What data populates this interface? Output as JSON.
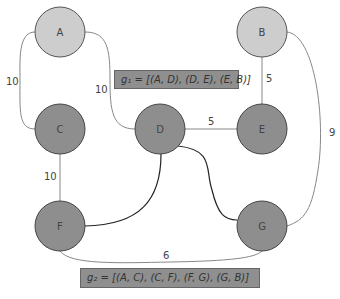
{
  "nodes": [
    {
      "id": "A",
      "label": "A",
      "x": 60,
      "y": 32,
      "fill": "#cdcdcd"
    },
    {
      "id": "B",
      "label": "B",
      "x": 262,
      "y": 32,
      "fill": "#cdcdcd"
    },
    {
      "id": "C",
      "label": "C",
      "x": 60,
      "y": 129,
      "fill": "#8e8e8e"
    },
    {
      "id": "D",
      "label": "D",
      "x": 160,
      "y": 129,
      "fill": "#8e8e8e"
    },
    {
      "id": "E",
      "label": "E",
      "x": 262,
      "y": 129,
      "fill": "#8e8e8e"
    },
    {
      "id": "F",
      "label": "F",
      "x": 60,
      "y": 226,
      "fill": "#8e8e8e"
    },
    {
      "id": "G",
      "label": "G",
      "x": 262,
      "y": 226,
      "fill": "#8e8e8e"
    }
  ],
  "edges": [
    {
      "from": "A",
      "to": "C",
      "weight": "10"
    },
    {
      "from": "A",
      "to": "D",
      "weight": "10"
    },
    {
      "from": "B",
      "to": "E",
      "weight": "5"
    },
    {
      "from": "B",
      "to": "G",
      "weight": "9"
    },
    {
      "from": "C",
      "to": "F",
      "weight": "10"
    },
    {
      "from": "D",
      "to": "E",
      "weight": "5"
    },
    {
      "from": "D",
      "to": "F",
      "weight": ""
    },
    {
      "from": "D",
      "to": "G",
      "weight": ""
    },
    {
      "from": "F",
      "to": "G",
      "weight": "6"
    }
  ],
  "labels": {
    "g1": "g₁ = [(A, D), (D, E), (E, B)]",
    "g2": "g₂ = [(A, C), (C, F), (F, G), (G, B)]"
  },
  "weights": {
    "ac": "10",
    "ad": "10",
    "be": "5",
    "bg": "9",
    "cf": "10",
    "de": "5",
    "fg": "6"
  },
  "node_labels": {
    "A": "A",
    "B": "B",
    "C": "C",
    "D": "D",
    "E": "E",
    "F": "F",
    "G": "G"
  }
}
